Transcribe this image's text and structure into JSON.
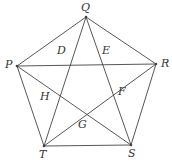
{
  "diagram": {
    "type": "pentagon-with-diagonals",
    "vertices": [
      {
        "name": "Q",
        "x": 86,
        "y": 17,
        "label_dx": -5,
        "label_dy": -15
      },
      {
        "name": "R",
        "x": 156,
        "y": 64,
        "label_dx": 5,
        "label_dy": -6
      },
      {
        "name": "S",
        "x": 131,
        "y": 145,
        "label_dx": -3,
        "label_dy": 3
      },
      {
        "name": "T",
        "x": 44,
        "y": 146,
        "label_dx": -5,
        "label_dy": 3
      },
      {
        "name": "P",
        "x": 17,
        "y": 66,
        "label_dx": -12,
        "label_dy": -7
      }
    ],
    "intersections": [
      {
        "name": "D",
        "x": 63,
        "y": 58
      },
      {
        "name": "E",
        "x": 103,
        "y": 58
      },
      {
        "name": "F",
        "x": 116,
        "y": 94
      },
      {
        "name": "G",
        "x": 82,
        "y": 117
      },
      {
        "name": "H",
        "x": 49,
        "y": 95
      }
    ],
    "edges": [
      [
        "P",
        "Q"
      ],
      [
        "Q",
        "R"
      ],
      [
        "R",
        "S"
      ],
      [
        "S",
        "T"
      ],
      [
        "T",
        "P"
      ]
    ],
    "diagonals": [
      [
        "P",
        "R"
      ],
      [
        "Q",
        "T"
      ],
      [
        "Q",
        "S"
      ],
      [
        "P",
        "S"
      ],
      [
        "R",
        "T"
      ]
    ],
    "stroke_color": "#444444"
  }
}
